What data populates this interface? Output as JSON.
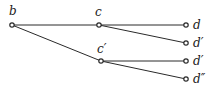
{
  "diagram": {
    "type": "tree",
    "stroke_color": "#2a2a2a",
    "nodes": [
      {
        "id": "b",
        "label": "b",
        "x": 12,
        "y": 25
      },
      {
        "id": "c",
        "label": "c",
        "x": 99,
        "y": 25
      },
      {
        "id": "c2",
        "label": "c′",
        "x": 101,
        "y": 61
      },
      {
        "id": "d",
        "label": "d",
        "x": 186,
        "y": 25
      },
      {
        "id": "d1",
        "label": "d′",
        "x": 186,
        "y": 43
      },
      {
        "id": "d2",
        "label": "d′",
        "x": 186,
        "y": 61
      },
      {
        "id": "d3",
        "label": "d″",
        "x": 186,
        "y": 79
      }
    ],
    "edges": [
      {
        "from": "b",
        "to": "c"
      },
      {
        "from": "b",
        "to": "c2"
      },
      {
        "from": "c",
        "to": "d"
      },
      {
        "from": "c",
        "to": "d1"
      },
      {
        "from": "c2",
        "to": "d2"
      },
      {
        "from": "c2",
        "to": "d3"
      }
    ]
  }
}
